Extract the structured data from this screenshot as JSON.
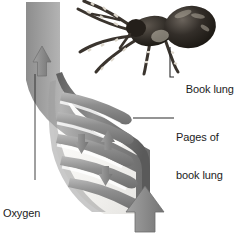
{
  "figure": {
    "name": "spider-book-lung-diagram",
    "background_color": "#ffffff",
    "width": 234,
    "height": 234
  },
  "labels": {
    "book_lung": "Book lung",
    "pages_line1": "Pages of",
    "pages_line2": "book lung",
    "oxygen_line1": "Oxygen",
    "oxygen_line2": "absorbed"
  },
  "illustration": {
    "spider": {
      "name": "spider-photo",
      "description": "dark banded-leg spider viewed from the side",
      "body_color": "#2a2623",
      "leg_color": "#4a443f",
      "highlight_color": "#d8d2c8"
    },
    "lung": {
      "name": "book-lung-cross-section",
      "wall_color": "#6d6d6d",
      "tube_color": "#8c8c8c",
      "interior_color": "#f2f1ee",
      "lamella_color": "#9a9a9a",
      "lamella_count": 5
    },
    "arrows": {
      "oxygen_out": {
        "name": "oxygen-out-arrow",
        "direction": "up",
        "color": "#8e8e8e"
      },
      "air_in": {
        "name": "air-intake-arrow",
        "direction": "up",
        "color": "#8b8b8b"
      },
      "internal": [
        {
          "name": "internal-arrow-up",
          "direction": "up",
          "color": "#8a8a8a"
        },
        {
          "name": "internal-arrow-down-1",
          "direction": "down",
          "color": "#8a8a8a"
        },
        {
          "name": "internal-arrow-down-2",
          "direction": "down",
          "color": "#8a8a8a"
        }
      ]
    },
    "leader_lines": {
      "color": "#2b2b2b",
      "book_lung": "elbow from label up to spider abdomen",
      "pages": "horizontal from label to top lamella tip",
      "oxygen": "vertical from oxygen arrow down to label"
    }
  }
}
